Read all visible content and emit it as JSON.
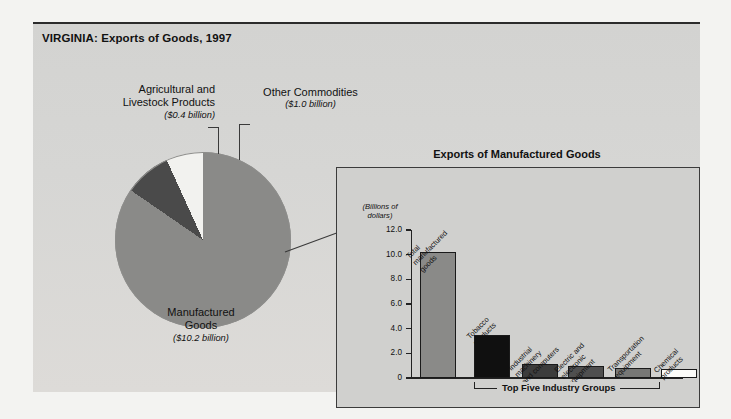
{
  "figure": {
    "title": "VIRGINIA: Exports of Goods, 1997"
  },
  "pie_labels": {
    "agricultural": {
      "line1": "Agricultural and",
      "line2": "Livestock Products",
      "amount": "($0.4 billion)"
    },
    "other": {
      "line1": "Other Commodities",
      "amount": "($1.0 billion)"
    },
    "manufactured": {
      "line1": "Manufactured",
      "line2": "Goods",
      "amount": "($10.2 billion)"
    }
  },
  "panel": {
    "title": "Exports of Manufactured Goods",
    "axis_caption_line1": "(Billions of",
    "axis_caption_line2": "dollars)",
    "bracket_label": "Top Five Industry Groups"
  },
  "colors": {
    "page_background": "#f3f3f1",
    "figure_background": "#d6d6d4",
    "panel_background": "#d0d0ce",
    "slice_manufactured": "#8a8a88",
    "slice_other": "#4a4a4a",
    "slice_agricultural": "#f2f2ef",
    "bar_total": "#8a8a88",
    "bar_tobacco": "#101010",
    "bar_industrial": "#3c3c3c",
    "bar_electric": "#4f4f4f",
    "bar_transportation": "#777775",
    "bar_chemical": "#fbfbf8",
    "axis": "#222222"
  },
  "chart_data": [
    {
      "type": "pie",
      "title": "VIRGINIA: Exports of Goods, 1997",
      "unit": "billions of dollars",
      "categories": [
        "Manufactured Goods",
        "Other Commodities",
        "Agricultural and Livestock Products"
      ],
      "values": [
        10.2,
        1.0,
        0.4
      ],
      "labels": [
        "($10.2 billion)",
        "($1.0 billion)",
        "($0.4 billion)"
      ],
      "colors": [
        "#8a8a88",
        "#4a4a4a",
        "#f2f2ef"
      ],
      "total": 11.6,
      "legend": "none"
    },
    {
      "type": "bar",
      "title": "Exports of Manufactured Goods",
      "xlabel": "",
      "ylabel": "(Billions of dollars)",
      "ylim": [
        0,
        12.0
      ],
      "yticks": [
        "0",
        "2.0",
        "4.0",
        "6.0",
        "8.0",
        "10.0",
        "12.0"
      ],
      "ytick_values": [
        0,
        2.0,
        4.0,
        6.0,
        8.0,
        10.0,
        12.0
      ],
      "grid": false,
      "legend": "none",
      "categories": [
        "Total manufactured goods",
        "Tobacco products",
        "Industrial machinery and computers",
        "Electric and electronic equipment",
        "Transportation equipment",
        "Chemical products"
      ],
      "values": [
        10.2,
        3.5,
        1.1,
        1.0,
        0.8,
        0.7
      ],
      "bar_colors": [
        "#8a8a88",
        "#101010",
        "#3c3c3c",
        "#4f4f4f",
        "#777775",
        "#fbfbf8"
      ],
      "annotation": "Top Five Industry Groups"
    }
  ],
  "bars": [
    {
      "label_lines": [
        "Total",
        "manufactured",
        "goods"
      ],
      "value": 10.2,
      "color": "#8a8a88",
      "left": 8,
      "width": 36
    },
    {
      "label_lines": [
        "Tobacco",
        "products"
      ],
      "value": 3.5,
      "color": "#101010",
      "left": 62,
      "width": 36
    },
    {
      "label_lines": [
        "Industrial",
        "machinery",
        "and computers"
      ],
      "value": 1.1,
      "color": "#3c3c3c",
      "left": 110,
      "width": 36
    },
    {
      "label_lines": [
        "Electric and",
        "electronic",
        "equipment"
      ],
      "value": 1.0,
      "color": "#4f4f4f",
      "left": 156,
      "width": 36
    },
    {
      "label_lines": [
        "Transportation",
        "equipment"
      ],
      "value": 0.8,
      "color": "#777775",
      "left": 203,
      "width": 36
    },
    {
      "label_lines": [
        "Chemical",
        "products"
      ],
      "value": 0.7,
      "color": "#fbfbf8",
      "left": 249,
      "width": 36
    }
  ],
  "yticks": [
    {
      "label": "12.0",
      "value": 12.0
    },
    {
      "label": "10.0",
      "value": 10.0
    },
    {
      "label": "8.0",
      "value": 8.0
    },
    {
      "label": "6.0",
      "value": 6.0
    },
    {
      "label": "4.0",
      "value": 4.0
    },
    {
      "label": "2.0",
      "value": 2.0
    },
    {
      "label": "0",
      "value": 0.0
    }
  ]
}
